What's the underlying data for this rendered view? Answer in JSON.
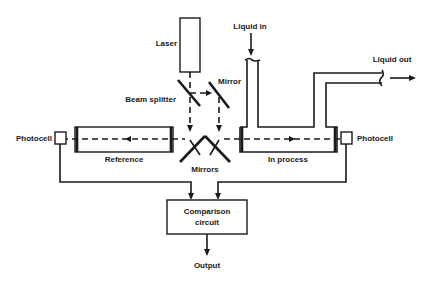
{
  "diagram": {
    "type": "optical comparison photometer schematic",
    "labels": {
      "laser": "Laser",
      "beam_splitter": "Beam splitter",
      "mirror": "Mirror",
      "mirrors": "Mirrors",
      "liquid_in": "Liquid in",
      "liquid_out": "Liquid out",
      "photocell_left": "Photocell",
      "photocell_right": "Photocell",
      "reference": "Reference",
      "in_process": "In process",
      "comparison_line1": "Comparison",
      "comparison_line2": "circuit",
      "output": "Output"
    },
    "components": [
      {
        "id": "laser",
        "label": "Laser"
      },
      {
        "id": "beam-splitter",
        "label": "Beam splitter"
      },
      {
        "id": "mirror",
        "label": "Mirror"
      },
      {
        "id": "mirrors",
        "label": "Mirrors"
      },
      {
        "id": "reference-cell",
        "label": "Reference"
      },
      {
        "id": "process-cell",
        "label": "In process"
      },
      {
        "id": "photocell-left",
        "label": "Photocell"
      },
      {
        "id": "photocell-right",
        "label": "Photocell"
      },
      {
        "id": "comparison-circuit",
        "label": "Comparison circuit"
      }
    ],
    "connections": [
      {
        "from": "laser",
        "to": "beam-splitter",
        "style": "dashed"
      },
      {
        "from": "beam-splitter",
        "to": "mirror",
        "style": "dashed"
      },
      {
        "from": "beam-splitter",
        "to": "mirrors",
        "style": "dashed"
      },
      {
        "from": "mirror",
        "to": "mirrors",
        "style": "dashed"
      },
      {
        "from": "mirrors",
        "to": "reference-cell",
        "style": "dashed"
      },
      {
        "from": "mirrors",
        "to": "process-cell",
        "style": "dashed"
      },
      {
        "from": "reference-cell",
        "to": "photocell-left",
        "style": "dashed"
      },
      {
        "from": "process-cell",
        "to": "photocell-right",
        "style": "dashed"
      },
      {
        "from": "photocell-left",
        "to": "comparison-circuit",
        "style": "solid"
      },
      {
        "from": "photocell-right",
        "to": "comparison-circuit",
        "style": "solid"
      },
      {
        "from": "comparison-circuit",
        "to": "output",
        "style": "solid"
      }
    ]
  }
}
